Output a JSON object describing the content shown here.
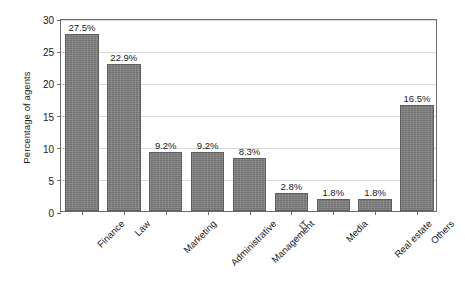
{
  "chart_data": {
    "type": "bar",
    "title": "",
    "xlabel": "",
    "ylabel": "Percentage of agents",
    "categories": [
      "Finance",
      "Law",
      "Marketing",
      "Administrative",
      "Management",
      "IT",
      "Media",
      "Real estate",
      "Others"
    ],
    "values": [
      27.5,
      22.9,
      9.2,
      9.2,
      8.3,
      2.8,
      1.8,
      1.8,
      16.5
    ],
    "data_labels": [
      "27.5%",
      "22.9%",
      "9.2%",
      "9.2%",
      "8.3%",
      "2.8%",
      "1.8%",
      "1.8%",
      "16.5%"
    ],
    "ylim": [
      0,
      30
    ],
    "yticks": [
      0,
      5,
      10,
      15,
      20,
      25,
      30
    ],
    "ytick_labels": [
      "0",
      "5",
      "10",
      "15",
      "20",
      "25",
      "30"
    ],
    "grid": true,
    "grid_axis": "y",
    "legend": false,
    "bar_color": "#7d7d7d",
    "bar_edge_color": "#5e5e5e",
    "grid_color": "#d8d8d8",
    "axis_color": "#6b6b6b",
    "text_color": "#1a1a1a",
    "background_color": "#ffffff",
    "xtick_label_rotation": -45
  }
}
